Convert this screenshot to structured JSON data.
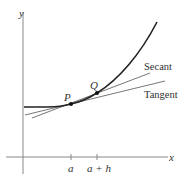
{
  "diagram": {
    "axes": {
      "x_label": "x",
      "y_label": "y"
    },
    "points": [
      {
        "id": "P",
        "label": "P"
      },
      {
        "id": "Q",
        "label": "Q"
      }
    ],
    "ticks": [
      {
        "id": "a",
        "label": "a"
      },
      {
        "id": "a_plus_h",
        "label": "a + h"
      }
    ],
    "lines": [
      {
        "id": "secant",
        "label": "Secant"
      },
      {
        "id": "tangent",
        "label": "Tangent"
      }
    ],
    "colors": {
      "axis": "#888888",
      "curve": "#222222",
      "lines": "#777777",
      "text": "#333333"
    }
  }
}
